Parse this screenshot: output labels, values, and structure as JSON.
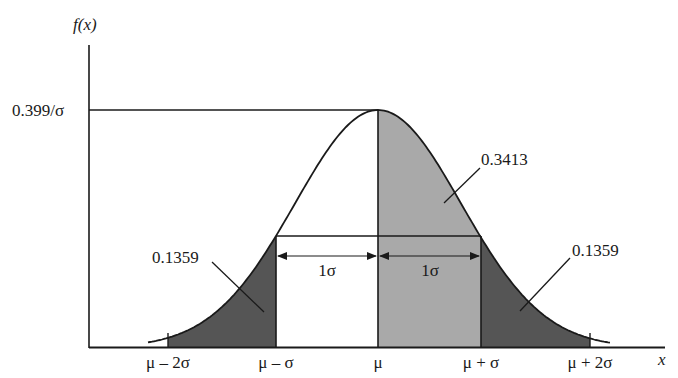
{
  "diagram": {
    "y_axis_label": "f(x)",
    "x_axis_label": "x",
    "peak_label": "0.399/σ",
    "tick_labels": [
      "μ – 2σ",
      "μ – σ",
      "μ",
      "μ + σ",
      "μ + 2σ"
    ],
    "sigma_span_labels": [
      "1σ",
      "1σ"
    ],
    "area_labels": {
      "left_tail": "0.1359",
      "center_right": "0.3413",
      "right_tail": "0.1359"
    },
    "colors": {
      "line": "#1a1a1a",
      "light_fill": "#a9a9a9",
      "dark_fill": "#555555",
      "background": "#ffffff"
    }
  },
  "chart_data": {
    "type": "area",
    "title": "",
    "xlabel": "x",
    "ylabel": "f(x)",
    "x_ticks": [
      "μ – 2σ",
      "μ – σ",
      "μ",
      "μ + σ",
      "μ + 2σ"
    ],
    "y_ticks": [
      "0.399/σ"
    ],
    "regions": [
      {
        "from": "μ – 2σ",
        "to": "μ – σ",
        "area": 0.1359,
        "fill": "dark"
      },
      {
        "from": "μ – σ",
        "to": "μ",
        "area": 0.3413,
        "fill": "none"
      },
      {
        "from": "μ",
        "to": "μ + σ",
        "area": 0.3413,
        "fill": "light"
      },
      {
        "from": "μ + σ",
        "to": "μ + 2σ",
        "area": 0.1359,
        "fill": "dark"
      }
    ],
    "annotations": [
      "1σ",
      "1σ"
    ],
    "grid": false,
    "legend": "none"
  }
}
